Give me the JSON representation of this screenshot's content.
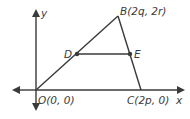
{
  "diagram": {
    "type": "coordinate-geometry",
    "axes": {
      "x_label": "x",
      "y_label": "y"
    },
    "points": {
      "O": {
        "label": "O(0, 0)"
      },
      "B": {
        "label": "B(2q, 2r)"
      },
      "C": {
        "label": "C(2p, 0)"
      },
      "D": {
        "label": "D"
      },
      "E": {
        "label": "E"
      }
    },
    "segments": [
      "OB",
      "BC",
      "OC",
      "DE"
    ],
    "colors": {
      "line": "#3a3a3a",
      "axis": "#3a3a3a",
      "text": "#3a3a3a"
    }
  }
}
